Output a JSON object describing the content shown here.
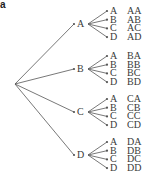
{
  "panel_label": "a",
  "tree": {
    "first_level": [
      "A",
      "B",
      "C",
      "D"
    ],
    "second_level": [
      "A",
      "B",
      "C",
      "D"
    ],
    "outcomes": [
      [
        "AA",
        "AB",
        "AC",
        "AD"
      ],
      [
        "BA",
        "BB",
        "BC",
        "BD"
      ],
      [
        "CA",
        "CB",
        "CC",
        "CD"
      ],
      [
        "DA",
        "DB",
        "DC",
        "DD"
      ]
    ]
  },
  "colors": {
    "line": "#555555",
    "text": "#3a3a3a"
  }
}
